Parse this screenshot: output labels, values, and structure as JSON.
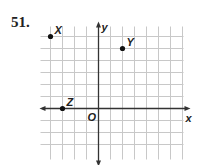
{
  "problem_number": "51.",
  "grid": {
    "origin_px": [
      98.5,
      108.5
    ],
    "unit_px": 12,
    "x_range": [
      -5,
      7
    ],
    "y_range": [
      -4,
      7
    ]
  },
  "axes": {
    "x_label": "x",
    "y_label": "y",
    "origin_label": "O"
  },
  "points": [
    {
      "label": "X",
      "x": -4,
      "y": 6
    },
    {
      "label": "Y",
      "x": 2,
      "y": 5
    },
    {
      "label": "Z",
      "x": -3,
      "y": 0
    }
  ],
  "colors": {
    "grid": "#c8c8c8",
    "axis": "#333333",
    "point": "#111111"
  }
}
